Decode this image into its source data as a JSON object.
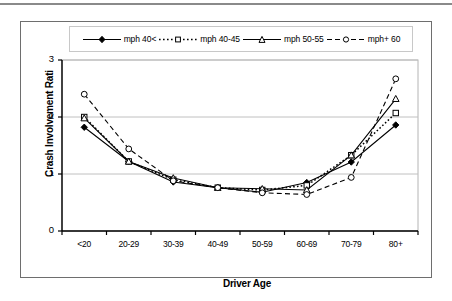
{
  "figure": {
    "frame_border_color": "#6e6e6e",
    "background": "#ffffff",
    "top_rule_color": "#8a8a8a"
  },
  "chart_data": {
    "type": "line",
    "title": "",
    "xlabel": "Driver Age",
    "ylabel": "Crash Involvement Rati",
    "categories": [
      "<20",
      "20-29",
      "30-39",
      "40-49",
      "50-59",
      "60-69",
      "70-79",
      "80+"
    ],
    "ylim": [
      0,
      3
    ],
    "yticks": [
      "0",
      "1",
      "2",
      "3"
    ],
    "ytick_values": [
      0,
      1,
      2,
      3
    ],
    "grid": "horizontal",
    "legend_position": "top",
    "series": [
      {
        "name": "mph 40<",
        "marker": "diamond-filled",
        "line_style": "solid",
        "color": "#000000",
        "values": [
          1.82,
          1.22,
          0.86,
          0.76,
          0.68,
          0.85,
          1.21,
          1.86
        ]
      },
      {
        "name": "mph 40-45",
        "marker": "square-open",
        "line_style": "dotted",
        "color": "#000000",
        "values": [
          2.0,
          1.22,
          0.9,
          0.76,
          0.72,
          0.8,
          1.33,
          2.07
        ]
      },
      {
        "name": "mph 50-55",
        "marker": "triangle-open",
        "line_style": "solid",
        "color": "#000000",
        "values": [
          1.98,
          1.22,
          0.93,
          0.76,
          0.74,
          0.72,
          1.33,
          2.32
        ]
      },
      {
        "name": "mph+ 60",
        "marker": "circle-open",
        "line_style": "dashed",
        "color": "#000000",
        "values": [
          2.4,
          1.44,
          0.88,
          0.76,
          0.67,
          0.64,
          0.94,
          2.67
        ]
      }
    ]
  },
  "legend": {
    "entries": [
      {
        "label": "mph 40<"
      },
      {
        "label": "mph 40-45"
      },
      {
        "label": "mph 50-55"
      },
      {
        "label": "mph+ 60"
      }
    ]
  },
  "axes": {
    "x_title": "Driver Age",
    "y_title": "Crash Involvement Rati"
  }
}
